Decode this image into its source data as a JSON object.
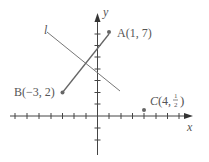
{
  "diagram": {
    "axes": {
      "x_label": "x",
      "y_label": "y"
    },
    "line_label": "l",
    "points": [
      {
        "name": "A",
        "label": "A(1, 7)",
        "x": 1,
        "y": 7
      },
      {
        "name": "B",
        "label": "B(−3, 2)",
        "x": -3,
        "y": 2
      },
      {
        "name": "C",
        "label_prefix": "C",
        "x_text": "4,",
        "frac_num": "1",
        "frac_den": "2",
        "x": 4,
        "y": 0.5
      }
    ],
    "colors": {
      "stroke": "#555555",
      "point": "#666666"
    }
  }
}
